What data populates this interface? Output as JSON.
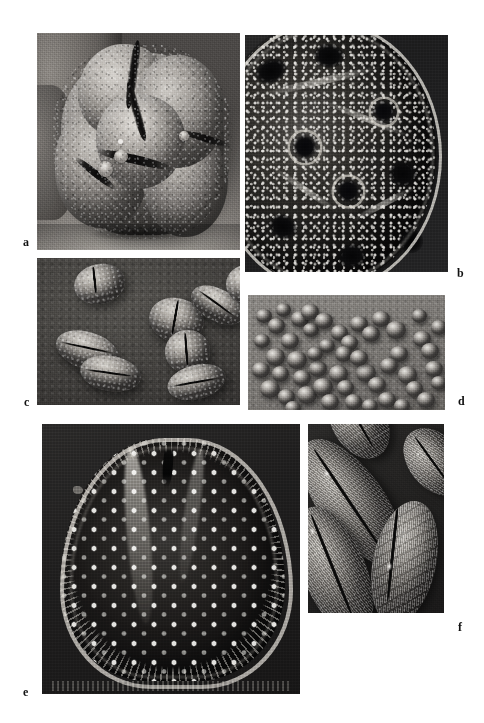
{
  "figure": {
    "kind": "scanning-electron-micrograph-plate",
    "background_color": "#ffffff",
    "width": 484,
    "height": 723,
    "panel_count": 6
  },
  "panels": [
    {
      "id": "a",
      "label": "a",
      "label_position": "bottom-left-outside",
      "subject": "single large trilobate pollen grain, polar view",
      "surface": "granular / scabrate exine with deep colpi and operculate knobs",
      "tone": "mid-grey grain on pale stage background",
      "box": {
        "x": 37,
        "y": 33,
        "w": 203,
        "h": 217
      }
    },
    {
      "id": "b",
      "label": "b",
      "label_position": "bottom-right-outside",
      "subject": "high-magnification detail of pollen grain surface with pores",
      "surface": "punctate / perforate exine, raised pore annuli, bright marginal ridge",
      "tone": "very dark field with bright puncta",
      "box": {
        "x": 245,
        "y": 35,
        "w": 203,
        "h": 237
      }
    },
    {
      "id": "c",
      "label": "c",
      "label_position": "bottom-left-outside",
      "subject": "group of seven bean-shaped monocolpate pollen grains",
      "surface": "granulate exine, single longitudinal sulcus per grain",
      "tone": "mid-grey grains on dark grey stage",
      "box": {
        "x": 37,
        "y": 258,
        "w": 203,
        "h": 147
      }
    },
    {
      "id": "d",
      "label": "d",
      "label_position": "bottom-right-outside",
      "subject": "scattered field of many small rounded pollen grains and dyads",
      "surface": "smooth psilate grains on textured stub",
      "tone": "light grey grains on mid-grey background",
      "box": {
        "x": 248,
        "y": 295,
        "w": 197,
        "h": 115
      }
    },
    {
      "id": "e",
      "label": "e",
      "label_position": "bottom-left-outside",
      "subject": "single large triangular (trilete-like) spore, distal face",
      "surface": "regularly punctate with bright spinules and spiny margin",
      "tone": "very dark body with regular bright dots",
      "box": {
        "x": 42,
        "y": 424,
        "w": 258,
        "h": 270
      }
    },
    {
      "id": "f",
      "label": "f",
      "label_position": "bottom-right-outside",
      "subject": "three elongate ellipsoidal monocolpate pollen grains",
      "surface": "striate-echinate exine with longitudinal colpus",
      "tone": "light grey grains on dark field",
      "box": {
        "x": 308,
        "y": 424,
        "w": 136,
        "h": 189
      }
    }
  ],
  "panel_c_grains": [
    {
      "x": 18,
      "y": 4,
      "w": 25,
      "h": 27,
      "rot": -12,
      "sulcus": {
        "x": 40,
        "y": 6,
        "w": 5,
        "h": 66,
        "rot": 6
      }
    },
    {
      "x": 55,
      "y": 27,
      "w": 27,
      "h": 30,
      "rot": 14,
      "sulcus": {
        "x": 44,
        "y": 4,
        "w": 6,
        "h": 80,
        "rot": -4
      }
    },
    {
      "x": 63,
      "y": 49,
      "w": 22,
      "h": 29,
      "rot": -6,
      "sulcus": {
        "x": 44,
        "y": 6,
        "w": 6,
        "h": 74,
        "rot": 2
      }
    },
    {
      "x": 75,
      "y": 21,
      "w": 28,
      "h": 22,
      "rot": 28,
      "sulcus": {
        "x": 6,
        "y": 44,
        "w": 84,
        "h": 6,
        "rot": 8
      }
    },
    {
      "x": 93,
      "y": 5,
      "w": 20,
      "h": 26,
      "rot": -8,
      "sulcus": {
        "x": 42,
        "y": 5,
        "w": 6,
        "h": 76,
        "rot": 4
      }
    },
    {
      "x": 9,
      "y": 50,
      "w": 32,
      "h": 25,
      "rot": 18,
      "sulcus": {
        "x": 5,
        "y": 42,
        "w": 86,
        "h": 6,
        "rot": -6
      }
    },
    {
      "x": 21,
      "y": 67,
      "w": 30,
      "h": 24,
      "rot": 10,
      "sulcus": {
        "x": 5,
        "y": 46,
        "w": 88,
        "h": 6,
        "rot": -2
      }
    },
    {
      "x": 64,
      "y": 73,
      "w": 29,
      "h": 23,
      "rot": -14,
      "sulcus": {
        "x": 5,
        "y": 48,
        "w": 86,
        "h": 6,
        "rot": 4
      }
    }
  ],
  "panel_d_grains": [
    {
      "x": 4,
      "y": 12,
      "s": 8
    },
    {
      "x": 10,
      "y": 20,
      "s": 9
    },
    {
      "x": 3,
      "y": 34,
      "s": 8
    },
    {
      "x": 9,
      "y": 46,
      "s": 10
    },
    {
      "x": 2,
      "y": 58,
      "s": 9
    },
    {
      "x": 12,
      "y": 62,
      "s": 9
    },
    {
      "x": 6,
      "y": 74,
      "s": 10
    },
    {
      "x": 15,
      "y": 82,
      "s": 9
    },
    {
      "x": 17,
      "y": 33,
      "s": 9
    },
    {
      "x": 20,
      "y": 49,
      "s": 10
    },
    {
      "x": 23,
      "y": 65,
      "s": 9
    },
    {
      "x": 25,
      "y": 79,
      "s": 10
    },
    {
      "x": 14,
      "y": 7,
      "s": 8
    },
    {
      "x": 22,
      "y": 14,
      "s": 9
    },
    {
      "x": 28,
      "y": 24,
      "s": 8
    },
    {
      "x": 31,
      "y": 57,
      "s": 9
    },
    {
      "x": 33,
      "y": 72,
      "s": 10
    },
    {
      "x": 37,
      "y": 86,
      "s": 9
    },
    {
      "x": 27,
      "y": 8,
      "s": 9
    },
    {
      "x": 34,
      "y": 16,
      "s": 9
    },
    {
      "x": 41,
      "y": 61,
      "s": 10
    },
    {
      "x": 45,
      "y": 74,
      "s": 9
    },
    {
      "x": 49,
      "y": 86,
      "s": 9
    },
    {
      "x": 42,
      "y": 26,
      "s": 9
    },
    {
      "x": 47,
      "y": 35,
      "s": 9
    },
    {
      "x": 44,
      "y": 44,
      "s": 9
    },
    {
      "x": 52,
      "y": 18,
      "s": 9
    },
    {
      "x": 58,
      "y": 27,
      "s": 9
    },
    {
      "x": 55,
      "y": 60,
      "s": 10
    },
    {
      "x": 61,
      "y": 71,
      "s": 9
    },
    {
      "x": 66,
      "y": 84,
      "s": 9
    },
    {
      "x": 63,
      "y": 14,
      "s": 9
    },
    {
      "x": 70,
      "y": 23,
      "s": 10
    },
    {
      "x": 72,
      "y": 44,
      "s": 9
    },
    {
      "x": 67,
      "y": 55,
      "s": 9
    },
    {
      "x": 76,
      "y": 62,
      "s": 10
    },
    {
      "x": 80,
      "y": 75,
      "s": 9
    },
    {
      "x": 84,
      "y": 31,
      "s": 9
    },
    {
      "x": 88,
      "y": 42,
      "s": 9
    },
    {
      "x": 83,
      "y": 12,
      "s": 8
    },
    {
      "x": 90,
      "y": 57,
      "s": 9
    },
    {
      "x": 86,
      "y": 84,
      "s": 9
    },
    {
      "x": 93,
      "y": 70,
      "s": 8
    },
    {
      "x": 36,
      "y": 38,
      "s": 8
    },
    {
      "x": 52,
      "y": 48,
      "s": 9
    },
    {
      "x": 19,
      "y": 92,
      "s": 8
    },
    {
      "x": 58,
      "y": 90,
      "s": 8
    },
    {
      "x": 74,
      "y": 90,
      "s": 8
    },
    {
      "x": 30,
      "y": 45,
      "s": 8
    },
    {
      "x": 93,
      "y": 22,
      "s": 8
    }
  ],
  "panel_f_grains": [
    {
      "x": 8,
      "y": 2,
      "w": 48,
      "h": 78,
      "rot": -36,
      "colpus": {
        "x": 45,
        "y": 6,
        "w": 6,
        "h": 80,
        "rot": 2
      },
      "spec": {
        "x": 40,
        "y": 22,
        "w": 9,
        "h": 6
      }
    },
    {
      "x": -4,
      "y": 42,
      "w": 46,
      "h": 72,
      "rot": -22,
      "colpus": {
        "x": 46,
        "y": 5,
        "w": 6,
        "h": 82,
        "rot": 0
      },
      "spec": {
        "x": 36,
        "y": 14,
        "w": 11,
        "h": 6
      }
    },
    {
      "x": 48,
      "y": 40,
      "w": 46,
      "h": 66,
      "rot": 12,
      "colpus": {
        "x": 26,
        "y": 6,
        "w": 7,
        "h": 78,
        "rot": -6
      },
      "spec": {
        "x": 22,
        "y": 52,
        "w": 12,
        "h": 7
      }
    },
    {
      "x": 74,
      "y": 0,
      "w": 38,
      "h": 40,
      "rot": -40,
      "colpus": {
        "x": 44,
        "y": 8,
        "w": 6,
        "h": 76,
        "rot": 4
      },
      "spec": {
        "x": 30,
        "y": 26,
        "w": 8,
        "h": 5
      }
    },
    {
      "x": 18,
      "y": -22,
      "w": 40,
      "h": 42,
      "rot": -30,
      "colpus": {
        "x": 46,
        "y": 6,
        "w": 6,
        "h": 80,
        "rot": 0
      },
      "spec": {
        "x": 32,
        "y": 30,
        "w": 8,
        "h": 5
      }
    }
  ]
}
